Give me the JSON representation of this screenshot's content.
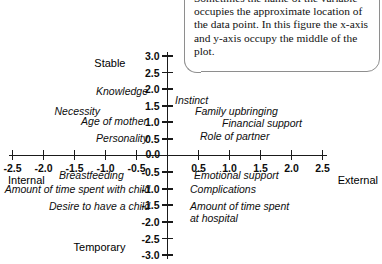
{
  "callout": {
    "text": "Sometimes the name of the variable occupies the approximate location of the data point. In this figure the x-axis and y-axis occupy the middle of the plot."
  },
  "chart_data": {
    "type": "scatter",
    "title": "",
    "xlabel": "",
    "ylabel": "",
    "xlim": [
      -2.5,
      2.5
    ],
    "ylim": [
      -3.0,
      3.0
    ],
    "grid": false,
    "legend": "none",
    "axes_position": "centered at origin",
    "xticks": [
      "-2.5",
      "-2.0",
      "-1.5",
      "-1.0",
      "-0.5",
      "0.0",
      "0.5",
      "1.0",
      "1.5",
      "2.0",
      "2.5"
    ],
    "yticks": [
      "3.0",
      "2.5",
      "2.0",
      "1.5",
      "1.0",
      "0.5",
      "0.0",
      "-0.5",
      "-1.0",
      "-1.5",
      "-2.0",
      "-2.5",
      "-3.0"
    ],
    "axis_poles": {
      "y_top": "Stable",
      "y_bottom": "Temporary",
      "x_left": "Internal",
      "x_right": "External"
    },
    "points": [
      {
        "label": "Knowledge",
        "x": -1.55,
        "y": 2.0
      },
      {
        "label": "Necessity",
        "x": -2.1,
        "y": 1.35
      },
      {
        "label": "Age of mother",
        "x": -1.2,
        "y": 1.0
      },
      {
        "label": "Personality",
        "x": -1.3,
        "y": 0.5
      },
      {
        "label": "Instinct",
        "x": 0.3,
        "y": 1.5
      },
      {
        "label": "Family upbringing",
        "x": 0.75,
        "y": 1.2
      },
      {
        "label": "Financial support",
        "x": 1.35,
        "y": 0.85
      },
      {
        "label": "Role of partner",
        "x": 0.9,
        "y": 0.5
      },
      {
        "label": "Breastfeeding",
        "x": -1.55,
        "y": -0.5
      },
      {
        "label": "Amount of time spent with child",
        "x": -1.3,
        "y": -1.0
      },
      {
        "label": "Desire to have a child",
        "x": -1.0,
        "y": -1.5
      },
      {
        "label": "Emotional support",
        "x": 1.0,
        "y": -0.5
      },
      {
        "label": "Complications",
        "x": 0.65,
        "y": -0.8
      },
      {
        "label": "Amount of time spent at hospital",
        "x": 0.9,
        "y": -1.45
      }
    ]
  }
}
